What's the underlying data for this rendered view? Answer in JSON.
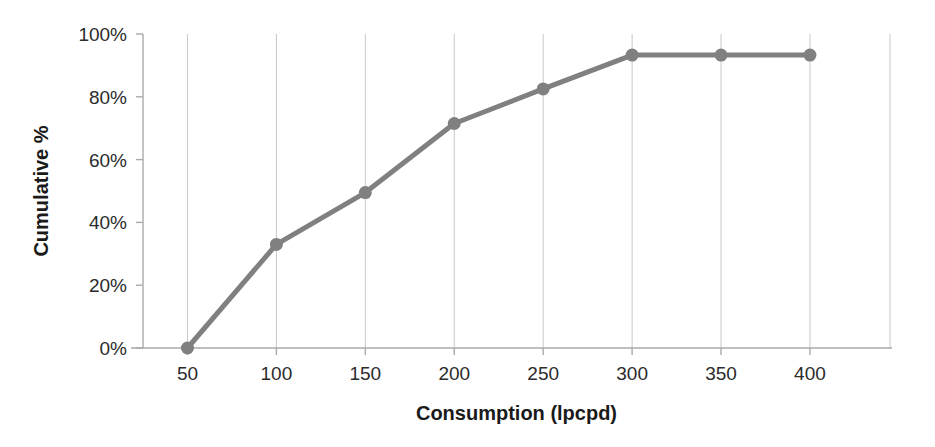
{
  "chart_data": {
    "type": "line",
    "title": "",
    "subtitle": "",
    "xlabel": "Consumption (lpcpd)",
    "ylabel": "Cumulative %",
    "x": [
      50,
      100,
      150,
      200,
      250,
      300,
      350,
      400
    ],
    "categories": [
      "50",
      "100",
      "150",
      "200",
      "250",
      "300",
      "350",
      "400"
    ],
    "values": [
      0,
      33,
      49.5,
      71.5,
      82.5,
      93.3,
      93.3,
      93.3
    ],
    "series": [
      {
        "name": "Cumulative %",
        "values": [
          0,
          33,
          49.5,
          71.5,
          82.5,
          93.3,
          93.3,
          93.3
        ]
      }
    ],
    "xlim": [
      25,
      445
    ],
    "ylim": [
      0,
      100
    ],
    "xticks": [
      50,
      100,
      150,
      200,
      250,
      300,
      350,
      400
    ],
    "yticks": [
      0,
      20,
      40,
      60,
      80,
      100
    ],
    "ytick_labels": [
      "0%",
      "20%",
      "40%",
      "60%",
      "80%",
      "100%"
    ],
    "xtick_labels": [
      "50",
      "100",
      "150",
      "200",
      "250",
      "300",
      "350",
      "400"
    ],
    "grid": "vertical",
    "legend": "none",
    "marker": "circle",
    "colors": {
      "line": "#808080",
      "marker": "#808080",
      "axis": "#aaaaaa",
      "gridline": "#c8c8c8",
      "tick_text": "#2b2b2b",
      "axis_title": "#1a1a1a",
      "background": "#ffffff"
    }
  }
}
